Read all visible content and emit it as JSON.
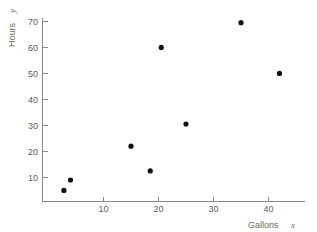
{
  "chart_data": {
    "type": "scatter",
    "title": "",
    "xlabel": "Gallons  x",
    "ylabel": "Hours  y",
    "xlabel_main": "Gallons",
    "xlabel_var": "x",
    "ylabel_main": "Hours",
    "ylabel_var": "y",
    "xlim": [
      0,
      45
    ],
    "ylim": [
      0,
      74
    ],
    "xticks": [
      10,
      20,
      30,
      40
    ],
    "yticks": [
      10,
      20,
      30,
      40,
      50,
      60,
      70
    ],
    "xtick_labels": [
      "10",
      "20",
      "30",
      "40"
    ],
    "ytick_labels": [
      "10",
      "20",
      "30",
      "40",
      "50",
      "60",
      "70"
    ],
    "grid": false,
    "legend": null,
    "marker_color": "#111111",
    "axis_color": "#8a8a8a",
    "label_color": "#6b6b4f",
    "points": [
      {
        "x": 2.8,
        "y": 5
      },
      {
        "x": 4.0,
        "y": 9
      },
      {
        "x": 15.0,
        "y": 22
      },
      {
        "x": 18.5,
        "y": 12.5
      },
      {
        "x": 20.5,
        "y": 60
      },
      {
        "x": 25.0,
        "y": 30.5
      },
      {
        "x": 35.0,
        "y": 69.5
      },
      {
        "x": 42.0,
        "y": 50
      }
    ]
  }
}
